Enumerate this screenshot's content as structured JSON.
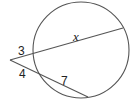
{
  "diagram": {
    "type": "intersecting secants from external point",
    "colors": {
      "stroke": "#555555",
      "text": "#222222",
      "background": "#ffffff"
    },
    "circle": {
      "cx": 81,
      "cy": 50,
      "r": 48
    },
    "external_point": {
      "x": 10,
      "y": 60
    },
    "secants": [
      {
        "name": "upper-secant",
        "near_intersection": {
          "x": 33,
          "y": 53
        },
        "far_intersection": {
          "x": 123,
          "y": 28
        },
        "external_segment_label": "3",
        "internal_segment_label": "x"
      },
      {
        "name": "lower-secant",
        "near_intersection": {
          "x": 39,
          "y": 75
        },
        "far_intersection": {
          "x": 88,
          "y": 97
        },
        "external_segment_label": "4",
        "internal_segment_label": "7"
      }
    ],
    "labels": {
      "upper_external": "3",
      "upper_internal": "x",
      "lower_external": "4",
      "lower_internal": "7"
    }
  }
}
